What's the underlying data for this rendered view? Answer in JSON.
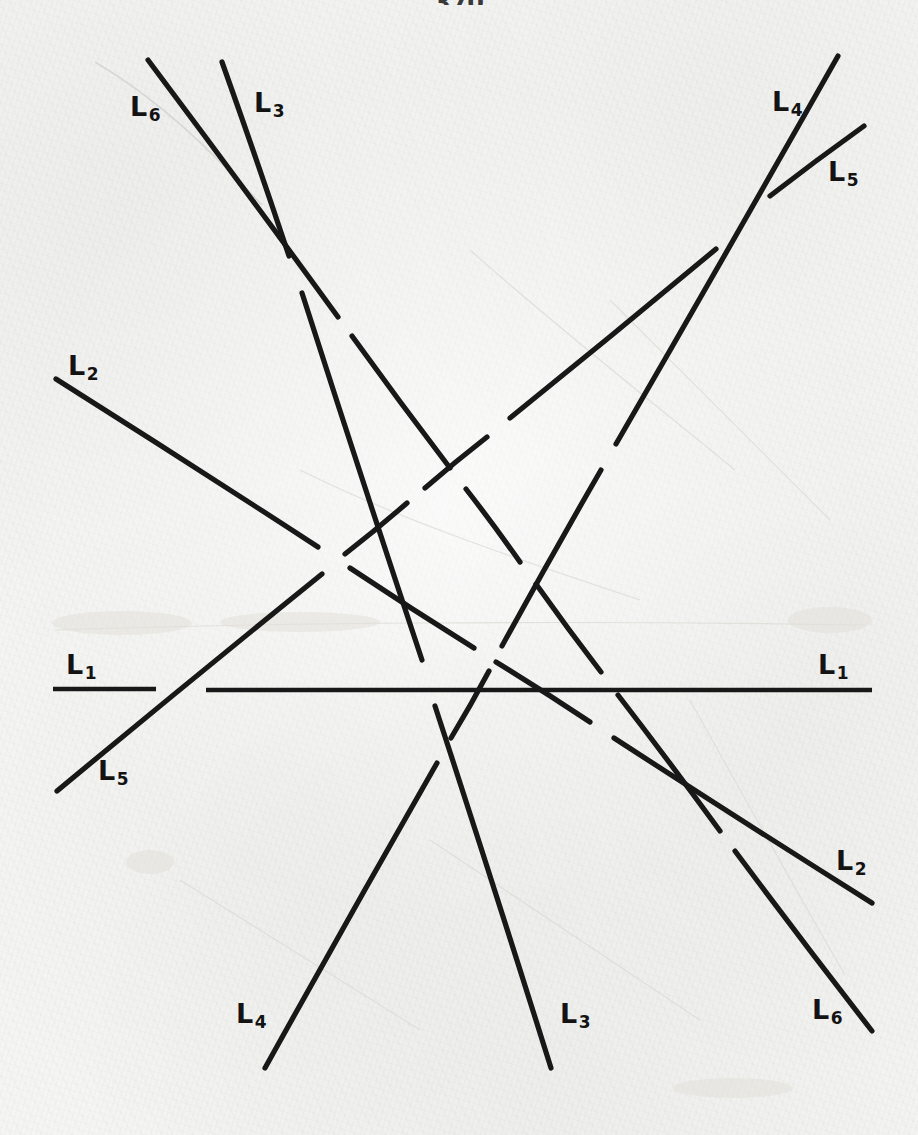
{
  "page": {
    "width": 918,
    "height": 1135,
    "background_color": "#f4f4f3",
    "ink_color": "#181818",
    "page_number": "370",
    "medium": "scanned-handwritten-paper"
  },
  "figure": {
    "caption": "",
    "type": "line-arrangement",
    "line_count": 6,
    "label_count": 12
  },
  "labels": [
    {
      "id": "L1-left",
      "base": "L",
      "sub": "1",
      "text": "L1",
      "x": 66,
      "y": 651
    },
    {
      "id": "L1-right",
      "base": "L",
      "sub": "1",
      "text": "L1",
      "x": 818,
      "y": 651
    },
    {
      "id": "L2-upper-left",
      "base": "L",
      "sub": "2",
      "text": "L2",
      "x": 68,
      "y": 352
    },
    {
      "id": "L2-lower-right",
      "base": "L",
      "sub": "2",
      "text": "L2",
      "x": 836,
      "y": 847
    },
    {
      "id": "L3-top",
      "base": "L",
      "sub": "3",
      "text": "L3",
      "x": 254,
      "y": 89
    },
    {
      "id": "L3-bottom",
      "base": "L",
      "sub": "3",
      "text": "L3",
      "x": 560,
      "y": 1000
    },
    {
      "id": "L4-top-right",
      "base": "L",
      "sub": "4",
      "text": "L4",
      "x": 772,
      "y": 88
    },
    {
      "id": "L4-bottom-left",
      "base": "L",
      "sub": "4",
      "text": "L4",
      "x": 236,
      "y": 1000
    },
    {
      "id": "L5-top-right",
      "base": "L",
      "sub": "5",
      "text": "L5",
      "x": 828,
      "y": 158
    },
    {
      "id": "L5-lower-left",
      "base": "L",
      "sub": "5",
      "text": "L5",
      "x": 98,
      "y": 757
    },
    {
      "id": "L6-top-left",
      "base": "L",
      "sub": "6",
      "text": "L6",
      "x": 130,
      "y": 93
    },
    {
      "id": "L6-bottom-right",
      "base": "L",
      "sub": "6",
      "text": "L6",
      "x": 812,
      "y": 996
    }
  ],
  "chart_data": {
    "type": "line",
    "title": "",
    "xlabel": "",
    "ylabel": "",
    "coordinate_space": "image-pixels",
    "xlim": [
      0,
      918
    ],
    "ylim": [
      0,
      1135
    ],
    "grid": false,
    "legend": "inline-endpoint-labels",
    "lines": [
      {
        "name": "L1",
        "label_left": "L1",
        "label_right": "L1",
        "orientation": "horizontal",
        "endpoints": [
          [
            53,
            689
          ],
          [
            872,
            690
          ]
        ],
        "segments": [
          [
            [
              53,
              689
            ],
            [
              156,
              689
            ]
          ],
          [
            [
              206,
              690
            ],
            [
              872,
              690
            ]
          ]
        ]
      },
      {
        "name": "L2",
        "label_left": "L2",
        "label_right": "L2",
        "orientation": "shallow-descending",
        "endpoints": [
          [
            56,
            379
          ],
          [
            872,
            903
          ]
        ],
        "segments": [
          [
            [
              56,
              379
            ],
            [
              318,
              547
            ]
          ],
          [
            [
              350,
              568
            ],
            [
              474,
              648
            ]
          ],
          [
            [
              496,
              662
            ],
            [
              590,
              722
            ]
          ],
          [
            [
              614,
              738
            ],
            [
              872,
              903
            ]
          ]
        ]
      },
      {
        "name": "L3",
        "label_top": "L3",
        "label_bottom": "L3",
        "orientation": "steep-descending",
        "endpoints": [
          [
            222,
            62
          ],
          [
            551,
            1068
          ]
        ],
        "segments": [
          [
            [
              222,
              62
            ],
            [
              289,
              256
            ]
          ],
          [
            [
              302,
              293
            ],
            [
              422,
              660
            ]
          ],
          [
            [
              435,
              706
            ],
            [
              551,
              1068
            ]
          ]
        ]
      },
      {
        "name": "L4",
        "label_top": "L4",
        "label_bottom": "L4",
        "orientation": "steep-ascending",
        "endpoints": [
          [
            265,
            1068
          ],
          [
            838,
            56
          ]
        ],
        "segments": [
          [
            [
              265,
              1068
            ],
            [
              437,
              763
            ]
          ],
          [
            [
              451,
              738
            ],
            [
              489,
              671
            ]
          ],
          [
            [
              502,
              646
            ],
            [
              601,
              470
            ]
          ],
          [
            [
              616,
              444
            ],
            [
              838,
              56
            ]
          ]
        ]
      },
      {
        "name": "L5",
        "label_left": "L5",
        "label_right": "L5",
        "orientation": "ascending",
        "endpoints": [
          [
            57,
            791
          ],
          [
            864,
            126
          ]
        ],
        "segments": [
          [
            [
              57,
              791
            ],
            [
              322,
              574
            ]
          ],
          [
            [
              345,
              554
            ],
            [
              407,
              503
            ]
          ],
          [
            [
              425,
              488
            ],
            [
              487,
              437
            ]
          ],
          [
            [
              510,
              418
            ],
            [
              716,
              249
            ]
          ],
          [
            [
              770,
              196
            ],
            [
              864,
              126
            ]
          ]
        ]
      },
      {
        "name": "L6",
        "label_left": "L6",
        "label_right": "L6",
        "orientation": "descending",
        "endpoints": [
          [
            148,
            60
          ],
          [
            872,
            1031
          ]
        ],
        "segments": [
          [
            [
              148,
              60
            ],
            [
              338,
              317
            ]
          ],
          [
            [
              352,
              336
            ],
            [
              450,
              468
            ]
          ],
          [
            [
              466,
              489
            ],
            [
              520,
              562
            ]
          ],
          [
            [
              536,
              584
            ],
            [
              601,
              672
            ]
          ],
          [
            [
              618,
              695
            ],
            [
              720,
              831
            ]
          ],
          [
            [
              735,
              851
            ],
            [
              872,
              1031
            ]
          ]
        ]
      }
    ]
  }
}
